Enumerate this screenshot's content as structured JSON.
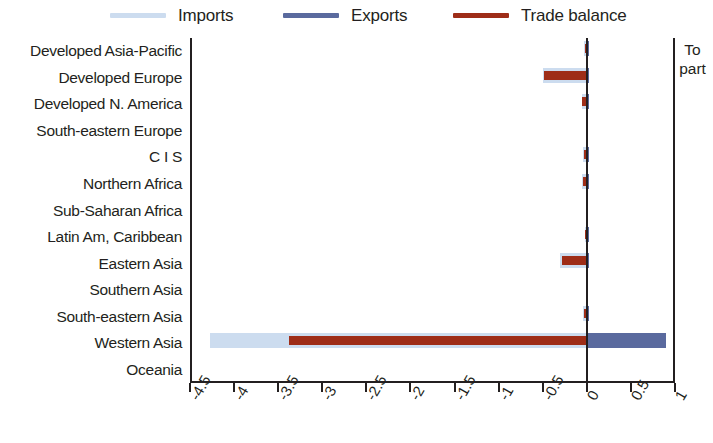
{
  "legend": {
    "items": [
      {
        "label": "Imports",
        "color": "#ccdcef",
        "name": "legend-imports"
      },
      {
        "label": "Exports",
        "color": "#5a6a9e",
        "name": "legend-exports"
      },
      {
        "label": "Trade balance",
        "color": "#9e2d18",
        "name": "legend-balance"
      }
    ]
  },
  "side_note": {
    "line1": "To",
    "line2": "part"
  },
  "chart_data": {
    "type": "bar",
    "orientation": "horizontal",
    "title": "",
    "xlabel": "",
    "ylabel": "",
    "xlim": [
      -4.5,
      1.0
    ],
    "xticks": [
      "-4.5",
      "-4",
      "-3.5",
      "-3",
      "-2.5",
      "-2",
      "-1.5",
      "-1",
      "-0.5",
      "0",
      "0.5",
      "1"
    ],
    "xtick_values": [
      -4.5,
      -4,
      -3.5,
      -3,
      -2.5,
      -2,
      -1.5,
      -1,
      -0.5,
      0,
      0.5,
      1
    ],
    "grid": false,
    "legend_position": "top",
    "zero_line": 0,
    "categories": [
      "Developed Asia-Pacific",
      "Developed Europe",
      "Developed N. America",
      "South-eastern Europe",
      "C I S",
      "Northern Africa",
      "Sub-Saharan Africa",
      "Latin Am, Caribbean",
      "Eastern Asia",
      "Southern Asia",
      "South-eastern Asia",
      "Western Asia",
      "Oceania"
    ],
    "series": [
      {
        "name": "Imports",
        "color": "#ccdcef",
        "values": [
          -0.03,
          -0.5,
          -0.06,
          -0.01,
          -0.04,
          -0.05,
          -0.01,
          -0.02,
          -0.3,
          -0.01,
          -0.04,
          -4.27,
          0.0
        ]
      },
      {
        "name": "Exports",
        "color": "#5a6a9e",
        "values": [
          0.01,
          0.01,
          0.01,
          0.0,
          0.01,
          0.01,
          0.0,
          0.01,
          0.02,
          0.0,
          0.01,
          0.9,
          0.0
        ]
      },
      {
        "name": "Trade balance",
        "color": "#9e2d18",
        "values": [
          -0.02,
          -0.48,
          -0.05,
          -0.01,
          -0.03,
          -0.04,
          -0.01,
          -0.02,
          -0.28,
          -0.01,
          -0.03,
          -3.38,
          0.0
        ]
      }
    ]
  }
}
